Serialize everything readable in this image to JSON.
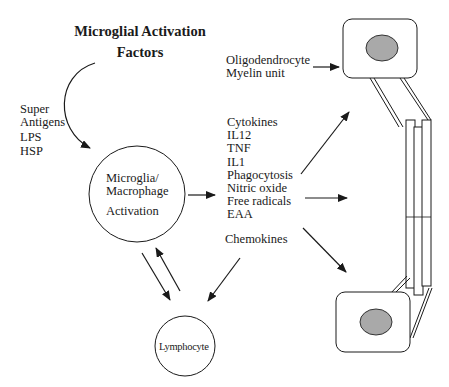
{
  "diagram": {
    "title_line1": "Microglial Activation",
    "title_line2": "Factors",
    "stimuli": {
      "line1": "Super",
      "line2": "Antigens",
      "line3": "LPS",
      "line4": "HSP"
    },
    "center_node": {
      "line1": "Microglia/",
      "line2": "Macrophage",
      "line3": "Activation"
    },
    "mediators": [
      "Cytokines",
      "IL12",
      "TNF",
      "IL1",
      "Phagocytosis",
      "Nitric oxide",
      "Free radicals",
      "EAA"
    ],
    "chemokines_label": "Chemokines",
    "lymphocyte_label": "Lymphocyte",
    "target": {
      "line1": "Oligodendrocyte",
      "line2": "Myelin unit"
    },
    "colors": {
      "line": "#222222",
      "nucleus_fill": "#a9a9a9",
      "background": "#ffffff"
    }
  }
}
